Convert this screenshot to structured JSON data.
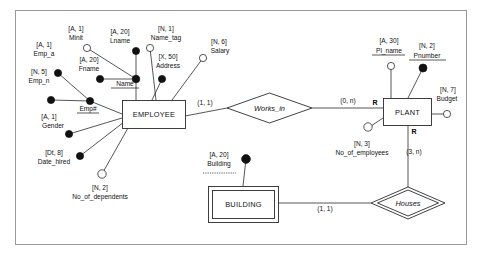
{
  "diagram": {
    "entities": [
      {
        "id": "employee",
        "name": "EMPLOYEE",
        "kind": "strong"
      },
      {
        "id": "plant",
        "name": "PLANT",
        "kind": "strong"
      },
      {
        "id": "building",
        "name": "BUILDING",
        "kind": "weak"
      }
    ],
    "relationships": [
      {
        "id": "works_in",
        "name": "Works_in",
        "kind": "regular"
      },
      {
        "id": "houses",
        "name": "Houses",
        "kind": "identifying"
      }
    ],
    "attributes": [
      {
        "id": "emp_a",
        "label": "Emp_a",
        "type": "[A, 1]",
        "marker": "filled",
        "underline": "none",
        "owner": "emp_num"
      },
      {
        "id": "emp_n",
        "label": "Emp_n",
        "type": "[N, 5]",
        "marker": "filled",
        "underline": "none",
        "owner": "emp_num"
      },
      {
        "id": "emp_num",
        "label": "Emp#",
        "type": "",
        "marker": "filled",
        "underline": "solid",
        "owner": "employee"
      },
      {
        "id": "minit",
        "label": "Minit",
        "type": "[A, 1]",
        "marker": "hollow",
        "underline": "none",
        "owner": "name"
      },
      {
        "id": "fname",
        "label": "Fname",
        "type": "[A, 20]",
        "marker": "filled",
        "underline": "none",
        "owner": "name"
      },
      {
        "id": "lname",
        "label": "Lname",
        "type": "[A, 20]",
        "marker": "filled",
        "underline": "none",
        "owner": "name"
      },
      {
        "id": "name",
        "label": "Name",
        "type": "",
        "marker": "filled",
        "underline": "solid",
        "owner": "employee"
      },
      {
        "id": "name_tag",
        "label": "Name_tag",
        "type": "[N, 1]",
        "marker": "hollow",
        "underline": "none",
        "owner": "employee"
      },
      {
        "id": "address",
        "label": "Address",
        "type": "[X, 50]",
        "marker": "filled",
        "underline": "none",
        "owner": "employee"
      },
      {
        "id": "salary",
        "label": "Salary",
        "type": "[N, 6]",
        "marker": "hollow",
        "underline": "none",
        "owner": "employee"
      },
      {
        "id": "gender",
        "label": "Gender",
        "type": "[A, 1]",
        "marker": "filled",
        "underline": "none",
        "owner": "employee"
      },
      {
        "id": "date_hired",
        "label": "Date_hired",
        "type": "[Dt, 8]",
        "marker": "filled",
        "underline": "none",
        "owner": "employee"
      },
      {
        "id": "no_of_dependents",
        "label": "No_of_dependents",
        "type": "[N, 2]",
        "marker": "hollow",
        "underline": "none",
        "owner": "employee"
      },
      {
        "id": "pl_name",
        "label": "Pl_name",
        "type": "[A, 30]",
        "marker": "hollow",
        "underline": "solid",
        "owner": "plant"
      },
      {
        "id": "pnumber",
        "label": "Pnumber",
        "type": "[N, 2]",
        "marker": "filled",
        "underline": "solid",
        "owner": "plant"
      },
      {
        "id": "budget",
        "label": "Budget",
        "type": "[N, 7]",
        "marker": "hollow",
        "underline": "none",
        "owner": "plant"
      },
      {
        "id": "no_of_employees",
        "label": "No_of_employees",
        "type": "[N, 3]",
        "marker": "hollow",
        "underline": "none",
        "owner": "plant"
      },
      {
        "id": "building_attr",
        "label": "Building",
        "type": "[A, 20]",
        "marker": "filled",
        "underline": "dashed",
        "owner": "building"
      }
    ],
    "cardinalities": [
      {
        "id": "emp-works-in",
        "text": "(1, 1)"
      },
      {
        "id": "plant-works-in",
        "text": "(0, n)"
      },
      {
        "id": "plant-houses",
        "text": "(3, n)"
      },
      {
        "id": "building-houses",
        "text": "(1, 1)"
      }
    ],
    "role_markers": [
      {
        "id": "plant-works-in-role",
        "text": "R"
      },
      {
        "id": "plant-houses-role",
        "text": "R"
      }
    ],
    "colors": {
      "line": "#2b2b2b",
      "frame": "#9a9a9a",
      "text": "#111111",
      "background": "#ffffff"
    }
  }
}
